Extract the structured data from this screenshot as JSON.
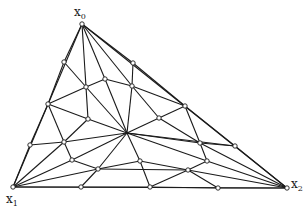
{
  "diagram": {
    "type": "triangulation",
    "vertices": [
      {
        "id": "x0",
        "label": "x",
        "subscript": "0",
        "x": 82,
        "y": 24,
        "lx": 74,
        "ly": 16
      },
      {
        "id": "x1",
        "label": "x",
        "subscript": "1",
        "x": 13,
        "y": 187,
        "lx": 6,
        "ly": 203
      },
      {
        "id": "x2",
        "label": "x",
        "subscript": "2",
        "x": 287,
        "y": 188,
        "lx": 291,
        "ly": 188
      }
    ],
    "nodes": [
      {
        "id": "a",
        "x": 64,
        "y": 62
      },
      {
        "id": "b",
        "x": 133,
        "y": 63
      },
      {
        "id": "c",
        "x": 105,
        "y": 79
      },
      {
        "id": "d",
        "x": 86,
        "y": 87
      },
      {
        "id": "e",
        "x": 132,
        "y": 86
      },
      {
        "id": "f",
        "x": 48,
        "y": 104
      },
      {
        "id": "g",
        "x": 185,
        "y": 106
      },
      {
        "id": "h",
        "x": 88,
        "y": 119
      },
      {
        "id": "i",
        "x": 159,
        "y": 118
      },
      {
        "id": "hub",
        "x": 127,
        "y": 133
      },
      {
        "id": "j",
        "x": 30,
        "y": 145
      },
      {
        "id": "k",
        "x": 64,
        "y": 142
      },
      {
        "id": "l",
        "x": 200,
        "y": 143
      },
      {
        "id": "m",
        "x": 235,
        "y": 146
      },
      {
        "id": "n",
        "x": 72,
        "y": 160
      },
      {
        "id": "o",
        "x": 207,
        "y": 161
      },
      {
        "id": "p",
        "x": 140,
        "y": 161
      },
      {
        "id": "q",
        "x": 98,
        "y": 169
      },
      {
        "id": "r",
        "x": 188,
        "y": 170
      },
      {
        "id": "s",
        "x": 81,
        "y": 187
      },
      {
        "id": "t",
        "x": 150,
        "y": 187
      },
      {
        "id": "u",
        "x": 218,
        "y": 188
      }
    ],
    "edges": [
      [
        "x0",
        "x1"
      ],
      [
        "x0",
        "x2"
      ],
      [
        "x1",
        "x2"
      ],
      [
        "x0",
        "a"
      ],
      [
        "x0",
        "d"
      ],
      [
        "x0",
        "c"
      ],
      [
        "x0",
        "e"
      ],
      [
        "x0",
        "b"
      ],
      [
        "a",
        "f"
      ],
      [
        "a",
        "d"
      ],
      [
        "b",
        "e"
      ],
      [
        "b",
        "g"
      ],
      [
        "c",
        "d"
      ],
      [
        "c",
        "e"
      ],
      [
        "c",
        "hub"
      ],
      [
        "d",
        "h"
      ],
      [
        "d",
        "f"
      ],
      [
        "d",
        "hub"
      ],
      [
        "e",
        "i"
      ],
      [
        "e",
        "g"
      ],
      [
        "e",
        "hub"
      ],
      [
        "f",
        "h"
      ],
      [
        "f",
        "k"
      ],
      [
        "f",
        "j"
      ],
      [
        "g",
        "i"
      ],
      [
        "g",
        "l"
      ],
      [
        "g",
        "m"
      ],
      [
        "h",
        "hub"
      ],
      [
        "h",
        "k"
      ],
      [
        "i",
        "hub"
      ],
      [
        "i",
        "l"
      ],
      [
        "hub",
        "k"
      ],
      [
        "hub",
        "n"
      ],
      [
        "hub",
        "q"
      ],
      [
        "hub",
        "p"
      ],
      [
        "hub",
        "l"
      ],
      [
        "hub",
        "o"
      ],
      [
        "hub",
        "m"
      ],
      [
        "j",
        "k"
      ],
      [
        "j",
        "x1"
      ],
      [
        "k",
        "n"
      ],
      [
        "k",
        "x1"
      ],
      [
        "l",
        "m"
      ],
      [
        "l",
        "o"
      ],
      [
        "l",
        "x2"
      ],
      [
        "m",
        "x2"
      ],
      [
        "n",
        "q"
      ],
      [
        "n",
        "x1"
      ],
      [
        "o",
        "r"
      ],
      [
        "o",
        "x2"
      ],
      [
        "p",
        "q"
      ],
      [
        "p",
        "r"
      ],
      [
        "p",
        "t"
      ],
      [
        "q",
        "x1"
      ],
      [
        "q",
        "s"
      ],
      [
        "q",
        "r"
      ],
      [
        "r",
        "u"
      ],
      [
        "r",
        "x2"
      ],
      [
        "r",
        "t"
      ],
      [
        "x1",
        "s"
      ],
      [
        "s",
        "t"
      ],
      [
        "t",
        "u"
      ],
      [
        "u",
        "x2"
      ]
    ]
  }
}
